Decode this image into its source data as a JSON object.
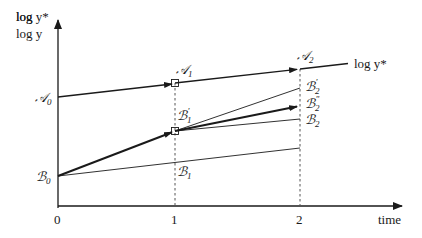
{
  "diagram": {
    "y_axis_label_line1": "log y*",
    "y_axis_label_line2": "log y",
    "x_axis_label": "time",
    "x_ticks": [
      "0",
      "1",
      "2"
    ],
    "curve_label": "log y*",
    "points": {
      "A0": {
        "letter": "𝒜",
        "sub": "0"
      },
      "A1": {
        "letter": "𝒜",
        "sub": "1"
      },
      "A2": {
        "letter": "𝒜",
        "sub": "2"
      },
      "B0": {
        "letter": "ℬ",
        "sub": "0"
      },
      "B1": {
        "letter": "ℬ",
        "sub": "1"
      },
      "B1p": {
        "letter": "ℬ",
        "sub": "1",
        "prime": "'"
      },
      "B2": {
        "letter": "ℬ",
        "sub": "2"
      },
      "B2p": {
        "letter": "ℬ",
        "sub": "2",
        "prime": "'"
      },
      "B2pp": {
        "letter": "ℬ",
        "sub": "2",
        "prime": "\""
      }
    },
    "colors": {
      "line": "#1a1a1a",
      "dashed": "#555555"
    }
  }
}
